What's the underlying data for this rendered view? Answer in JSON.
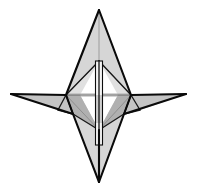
{
  "figure": {
    "title": "Four-pointed polyhedral star wireframe",
    "background_color": "#ffffff",
    "outline_color": "#0a0a0a",
    "fill_light": "#d6d6d6",
    "fill_mid": "#c4c4c4",
    "fill_dark": "#b0b0b0",
    "fill_pale": "#e0e0e0",
    "axis_rod_color": "#f4f4f4",
    "axis_rod_shade": "#cfcfcf",
    "canvas": {
      "width": 197,
      "height": 189
    }
  },
  "chart_data": {
    "type": "diagram",
    "title": "Four-pointed polyhedral star wireframe",
    "xlabel": "",
    "ylabel": "",
    "grid": false,
    "legend": "none",
    "xlim": [
      0,
      197
    ],
    "ylim": [
      0,
      189
    ],
    "vertices": {
      "top_apex": [
        99,
        10
      ],
      "bottom_apex": [
        99,
        182
      ],
      "left_tip": [
        11,
        94
      ],
      "right_tip": [
        186,
        94
      ],
      "left_hub": [
        66,
        95
      ],
      "right_hub": [
        131,
        95
      ],
      "upper_node": [
        99,
        61
      ],
      "lower_node": [
        99,
        130
      ],
      "left_low": [
        73,
        114
      ],
      "right_low": [
        124,
        114
      ],
      "left_mid": [
        80,
        95
      ],
      "right_mid": [
        118,
        95
      ],
      "left_wing_low": [
        58,
        110
      ],
      "right_wing_low": [
        140,
        110
      ]
    },
    "edges": [
      [
        "top_apex",
        "left_hub"
      ],
      [
        "top_apex",
        "right_hub"
      ],
      [
        "top_apex",
        "upper_node"
      ],
      [
        "bottom_apex",
        "left_low"
      ],
      [
        "bottom_apex",
        "right_low"
      ],
      [
        "bottom_apex",
        "lower_node"
      ],
      [
        "left_tip",
        "left_hub"
      ],
      [
        "right_tip",
        "right_hub"
      ],
      [
        "left_hub",
        "right_hub"
      ],
      [
        "left_hub",
        "upper_node"
      ],
      [
        "right_hub",
        "upper_node"
      ],
      [
        "left_hub",
        "lower_node"
      ],
      [
        "right_hub",
        "lower_node"
      ],
      [
        "left_hub",
        "left_low"
      ],
      [
        "right_hub",
        "right_low"
      ],
      [
        "left_low",
        "lower_node"
      ],
      [
        "right_low",
        "lower_node"
      ],
      [
        "left_tip",
        "left_wing_low"
      ],
      [
        "right_tip",
        "right_wing_low"
      ]
    ]
  }
}
